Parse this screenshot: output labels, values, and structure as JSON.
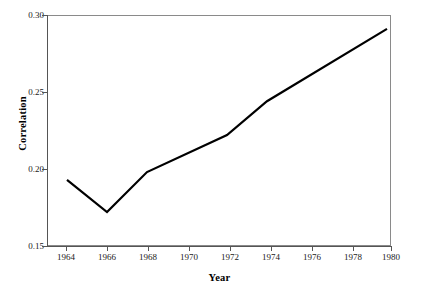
{
  "chart_data": {
    "type": "line",
    "title": "",
    "subtitle": "",
    "xlabel": "Year",
    "ylabel": "Correlation",
    "x": [
      1964,
      1966,
      1968,
      1972,
      1974,
      1980
    ],
    "values": [
      0.193,
      0.172,
      0.198,
      0.222,
      0.244,
      0.291
    ],
    "series": [
      {
        "name": "Correlation",
        "x": [
          1964,
          1966,
          1968,
          1972,
          1974,
          1980
        ],
        "values": [
          0.193,
          0.172,
          0.198,
          0.222,
          0.244,
          0.291
        ],
        "color": "#000000"
      }
    ],
    "xlim": [
      1963,
      1980.2
    ],
    "ylim": [
      0.15,
      0.3
    ],
    "xticks": [
      1964,
      1966,
      1968,
      1970,
      1972,
      1974,
      1976,
      1978,
      1980
    ],
    "xticklabels": [
      "1964",
      "1966",
      "1968",
      "1970",
      "1972",
      "1974",
      "1976",
      "1978",
      "1980"
    ],
    "yticks": [
      0.15,
      0.2,
      0.25,
      0.3
    ],
    "yticklabels": [
      "0.15",
      "0.20",
      "0.25",
      "0.30"
    ],
    "grid": false,
    "legend": false,
    "legend_position": "none",
    "line_width": 2,
    "markers": false,
    "background_color": "#ffffff",
    "axis_color": "#555555",
    "text_color": "#000000"
  },
  "axes": {
    "ylabel": "Correlation",
    "xlabel": "Year",
    "ytick_labels": [
      "0.30",
      "0.25",
      "0.20",
      "0.15"
    ],
    "xtick_labels": [
      "1964",
      "1966",
      "1968",
      "1970",
      "1972",
      "1974",
      "1976",
      "1978",
      "1980"
    ]
  }
}
